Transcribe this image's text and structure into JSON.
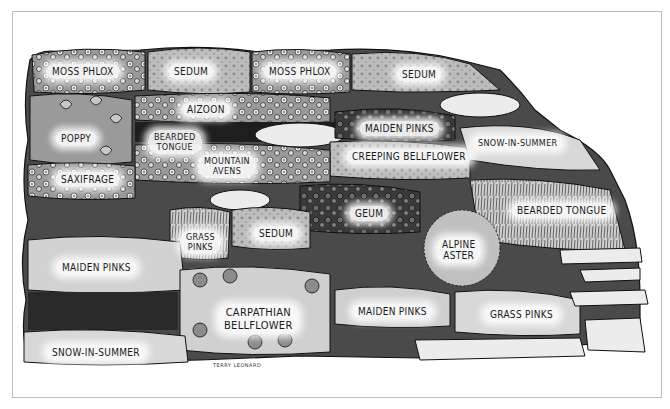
{
  "illustration": {
    "title": "Rock garden planting illustration",
    "style": "black-and-white ink and wash",
    "signature": "TERRY LEONARD",
    "colors": {
      "background": "#ffffff",
      "frame": "#bdbdbd",
      "ink": "#1a1a1a",
      "dark_wash": "#3a3a3a",
      "mid_wash": "#8a8a8a",
      "light_wash": "#c8c8c8",
      "stone": "#ececec"
    }
  },
  "labels": [
    {
      "id": "moss-phlox-1",
      "text": "MOSS PHLOX",
      "x": 46,
      "y": 69
    },
    {
      "id": "sedum-1",
      "text": "SEDUM",
      "x": 168,
      "y": 69
    },
    {
      "id": "moss-phlox-2",
      "text": "MOSS PHLOX",
      "x": 263,
      "y": 69
    },
    {
      "id": "sedum-2",
      "text": "SEDUM",
      "x": 396,
      "y": 72
    },
    {
      "id": "aizoon",
      "text": "AIZOON",
      "x": 181,
      "y": 107
    },
    {
      "id": "poppy",
      "text": "POPPY",
      "x": 55,
      "y": 134
    },
    {
      "id": "bearded-tongue-1",
      "text": "BEARDED\nTONGUE",
      "x": 150,
      "y": 133
    },
    {
      "id": "maiden-pinks-1",
      "text": "MAIDEN PINKS",
      "x": 359,
      "y": 123
    },
    {
      "id": "snow-in-summer-1",
      "text": "SNOW-IN-SUMMER",
      "x": 472,
      "y": 137
    },
    {
      "id": "mountain-avens",
      "text": "MOUNTAIN\nAVENS",
      "x": 202,
      "y": 158
    },
    {
      "id": "creeping-bellflower",
      "text": "CREEPING BELLFLOWER",
      "x": 346,
      "y": 152
    },
    {
      "id": "saxifrage",
      "text": "SAXIFRAGE",
      "x": 55,
      "y": 175
    },
    {
      "id": "geum",
      "text": "GEUM",
      "x": 349,
      "y": 206
    },
    {
      "id": "bearded-tongue-2",
      "text": "BEARDED TONGUE",
      "x": 511,
      "y": 206
    },
    {
      "id": "grass-pinks-1",
      "text": "GRASS\nPINKS",
      "x": 185,
      "y": 233
    },
    {
      "id": "sedum-3",
      "text": "SEDUM",
      "x": 253,
      "y": 226
    },
    {
      "id": "alpine-aster",
      "text": "ALPINE\nASTER",
      "x": 438,
      "y": 240
    },
    {
      "id": "maiden-pinks-2",
      "text": "MAIDEN PINKS",
      "x": 56,
      "y": 262
    },
    {
      "id": "carpathian-bellflower",
      "text": "CARPATHIAN\nBELLFLOWER",
      "x": 220,
      "y": 303
    },
    {
      "id": "maiden-pinks-3",
      "text": "MAIDEN PINKS",
      "x": 355,
      "y": 304
    },
    {
      "id": "grass-pinks-2",
      "text": "GRASS PINKS",
      "x": 484,
      "y": 307
    },
    {
      "id": "snow-in-summer-2",
      "text": "SNOW-IN-SUMMER",
      "x": 46,
      "y": 346
    }
  ]
}
